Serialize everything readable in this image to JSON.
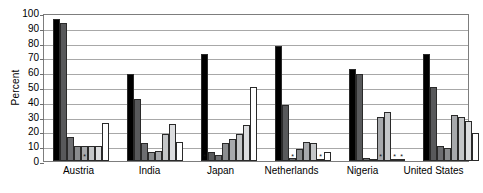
{
  "top_sliver_text": "",
  "chart_data": {
    "type": "bar",
    "title": "",
    "xlabel": "",
    "ylabel": "Percent",
    "ylim": [
      0,
      100
    ],
    "ytick_step": 10,
    "ytick_labels": [
      "100",
      "90",
      "80",
      "70",
      "60",
      "50",
      "40",
      "30",
      "20",
      "10",
      "0"
    ],
    "grid": true,
    "legend": "none",
    "categories": [
      "Austria",
      "India",
      "Japan",
      "Netherlands",
      "Nigeria",
      "United States"
    ],
    "series": [
      {
        "name": "Series 1",
        "color": "#000000",
        "values": [
          96,
          59,
          72,
          78,
          62,
          72
        ]
      },
      {
        "name": "Series 2",
        "color": "#58595b",
        "values": [
          93,
          42,
          6,
          38,
          59,
          50
        ]
      },
      {
        "name": "Series 3",
        "color": "#6d6e71",
        "values": [
          16,
          12,
          4,
          2,
          2,
          10
        ]
      },
      {
        "name": "Series 4",
        "color": "#8a8c8e",
        "values": [
          10,
          6,
          12,
          8,
          1,
          9
        ]
      },
      {
        "name": "Series 5",
        "color": "#a7a9ac",
        "values": [
          10,
          7,
          15,
          13,
          30,
          31
        ]
      },
      {
        "name": "Series 6",
        "color": "#c4c6c8",
        "values": [
          10,
          18,
          18,
          12,
          33,
          30
        ]
      },
      {
        "name": "Series 7",
        "color": "#dcdddf",
        "values": [
          10,
          25,
          24,
          1,
          1,
          27
        ]
      },
      {
        "name": "Series 8",
        "color": "#ffffff",
        "values": [
          26,
          13,
          50,
          6,
          1,
          19
        ]
      }
    ],
    "suppressed_markers": {
      "note": "asterisk marks very small / suppressed values drawn at baseline",
      "cells": [
        {
          "category": "Austria",
          "series_index": 4
        },
        {
          "category": "Japan",
          "series_index": 0
        },
        {
          "category": "Netherlands",
          "series_index": 2
        },
        {
          "category": "Netherlands",
          "series_index": 6
        },
        {
          "category": "Nigeria",
          "series_index": 4
        },
        {
          "category": "Nigeria",
          "series_index": 6
        },
        {
          "category": "Nigeria",
          "series_index": 7
        }
      ]
    }
  }
}
